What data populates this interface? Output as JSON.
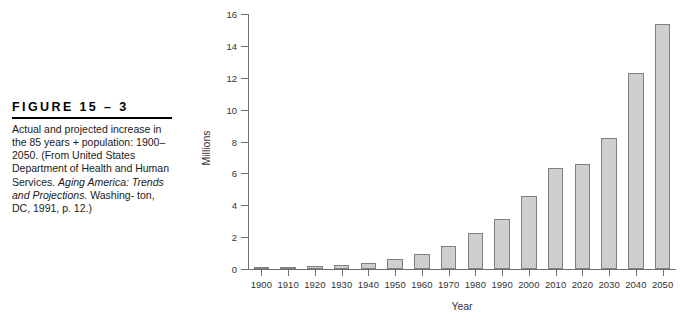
{
  "figure": {
    "heading": "FIGURE  15 – 3",
    "caption_line1": "Actual and projected increase in",
    "caption_line2": "the 85 years + population:",
    "caption_line3": "1900–2050. (From United",
    "caption_line4": "States Department of Health and",
    "caption_line5": "Human Services. ",
    "caption_italic1": "Aging America:",
    "caption_line6": "Trends and Projections.",
    "caption_line7": " Washing-",
    "caption_line8": "ton, DC, 1991, p. 12.)"
  },
  "chart_data": {
    "type": "bar",
    "title": "",
    "xlabel": "Year",
    "ylabel": "Millions",
    "ylim": [
      0,
      16
    ],
    "yticks": [
      0,
      2,
      4,
      6,
      8,
      10,
      12,
      14,
      16
    ],
    "grid": false,
    "legend": "none",
    "bar_color": "#cfcfcf",
    "bar_border_color": "#808080",
    "categories": [
      "1900",
      "1910",
      "1920",
      "1930",
      "1940",
      "1950",
      "1960",
      "1970",
      "1980",
      "1990",
      "2000",
      "2010",
      "2020",
      "2030",
      "2040",
      "2050"
    ],
    "values": [
      0.1,
      0.15,
      0.2,
      0.25,
      0.35,
      0.6,
      0.95,
      1.45,
      2.25,
      3.15,
      4.6,
      6.35,
      6.6,
      8.25,
      12.3,
      15.4
    ]
  }
}
